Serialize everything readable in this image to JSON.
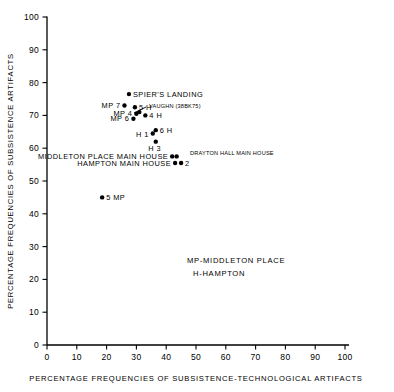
{
  "chart_data": {
    "type": "scatter",
    "title": "",
    "xlabel": "PERCENTAGE FREQUENCIES OF SUBSISTENCE-TECHNOLOGICAL ARTIFACTS",
    "ylabel": "PERCENTAGE FREQUENCIES OF SUBSISTENCE ARTIFACTS",
    "xlim": [
      0,
      100
    ],
    "ylim": [
      0,
      100
    ],
    "xticks": [
      "0",
      "10",
      "20",
      "30",
      "40",
      "50",
      "60",
      "70",
      "80",
      "90",
      "100"
    ],
    "yticks": [
      "0",
      "10",
      "20",
      "30",
      "40",
      "50",
      "60",
      "70",
      "80",
      "90",
      "100"
    ],
    "grid": false,
    "legend_position": "inside-center",
    "points": [
      {
        "id": "spiers-landing",
        "x": 27.5,
        "y": 76.5,
        "label": "SPIER'S LANDING",
        "label_side": "right"
      },
      {
        "id": "mp7",
        "x": 26.0,
        "y": 73.0,
        "label": "MP 7",
        "label_side": "left"
      },
      {
        "id": "h5",
        "x": 29.5,
        "y": 72.5,
        "label": "5 H",
        "label_side": "right"
      },
      {
        "id": "vaughn",
        "x": 31.0,
        "y": 71.0,
        "label": "VAUGHN (38BK75)",
        "label_side": "right"
      },
      {
        "id": "mp4",
        "x": 30.0,
        "y": 70.5,
        "label": "MP 4",
        "label_side": "left"
      },
      {
        "id": "h4",
        "x": 33.0,
        "y": 70.0,
        "label": "4 H",
        "label_side": "right"
      },
      {
        "id": "mp6",
        "x": 29.0,
        "y": 69.0,
        "label": "MP 6",
        "label_side": "left"
      },
      {
        "id": "h6",
        "x": 36.5,
        "y": 65.5,
        "label": "6 H",
        "label_side": "right"
      },
      {
        "id": "h1",
        "x": 35.5,
        "y": 64.5,
        "label": "H 1",
        "label_side": "left"
      },
      {
        "id": "h3",
        "x": 36.5,
        "y": 62.0,
        "label": "H 3",
        "label_side": "below"
      },
      {
        "id": "middleton-place-main-house",
        "x": 42.0,
        "y": 57.5,
        "label": "MIDDLETON PLACE MAIN HOUSE",
        "label_side": "left"
      },
      {
        "id": "drayton-hall-main-house",
        "x": 43.5,
        "y": 57.5,
        "label": "DRAYTON HALL MAIN HOUSE",
        "label_side": "right"
      },
      {
        "id": "hampton-main-house",
        "x": 43.0,
        "y": 55.5,
        "label": "HAMPTON MAIN HOUSE",
        "label_side": "left"
      },
      {
        "id": "mp2",
        "x": 45.0,
        "y": 55.5,
        "label": "2",
        "label_side": "right"
      },
      {
        "id": "mp5",
        "x": 18.5,
        "y": 45.0,
        "label": "5 MP",
        "label_side": "right"
      }
    ],
    "annotations": [
      {
        "id": "legend-mp",
        "text": "MP-MIDDLETON PLACE",
        "x": 47,
        "y": 25
      },
      {
        "id": "legend-h",
        "text": "H-HAMPTON",
        "x": 49,
        "y": 21
      }
    ]
  }
}
